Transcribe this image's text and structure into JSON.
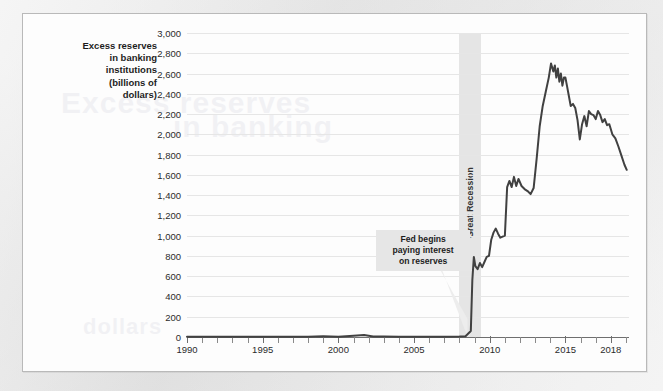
{
  "figure": {
    "y_axis_title": "Excess reserves\nin banking\ninstitutions\n(billions of\ndollars)",
    "recession_label": "Great Recession",
    "annotation": "Fed begins\npaying interest\non reserves"
  },
  "colors": {
    "line": "#414141",
    "grid": "#e6e6e6",
    "band": "#e4e4e4",
    "annotation_bg": "#e6e6e6",
    "card_bg": "#fdfdfd",
    "page_bg": "#e9e9e9",
    "axis": "#6f6f6f",
    "text": "#1d1d1d"
  },
  "bleed_text": {
    "line1": "Excess reserves",
    "line2": "in banking",
    "line3": "dollars"
  },
  "chart_data": {
    "type": "line",
    "title": "",
    "xlabel": "",
    "ylabel": "Excess reserves in banking institutions (billions of dollars)",
    "xlim": [
      1990,
      2019.2
    ],
    "ylim": [
      0,
      3000
    ],
    "ytick_step": 200,
    "grid": true,
    "legend": false,
    "yticks": [
      0,
      200,
      400,
      600,
      800,
      1000,
      1200,
      1400,
      1600,
      1800,
      2000,
      2200,
      2400,
      2600,
      2800,
      3000
    ],
    "ytick_labels": [
      "0",
      "200",
      "400",
      "600",
      "800",
      "1,000",
      "1,200",
      "1,400",
      "1,600",
      "1,800",
      "2,000",
      "2,200",
      "2,400",
      "2,600",
      "2,800",
      "3,000"
    ],
    "xticks": [
      1990,
      1991,
      1992,
      1993,
      1994,
      1995,
      1996,
      1997,
      1998,
      1999,
      2000,
      2001,
      2002,
      2003,
      2004,
      2005,
      2006,
      2007,
      2008,
      2009,
      2010,
      2011,
      2012,
      2013,
      2014,
      2015,
      2016,
      2017,
      2018,
      2019
    ],
    "xtick_labels_shown": [
      "1990",
      "1995",
      "2000",
      "2005",
      "2010",
      "2015",
      "2018"
    ],
    "xtick_labels_values": [
      1990,
      1995,
      2000,
      2005,
      2010,
      2015,
      2018
    ],
    "shaded_regions": [
      {
        "label": "Great Recession",
        "x_start": 2007.95,
        "x_end": 2009.45
      }
    ],
    "annotations": [
      {
        "text": "Fed begins paying interest on reserves",
        "x": 2005.6,
        "y": 480,
        "points_to_x": 2008.6,
        "points_to_y": 60
      }
    ],
    "series": [
      {
        "name": "Excess reserves",
        "x": [
          1990.0,
          1991.0,
          1992.0,
          1993.0,
          1994.0,
          1995.0,
          1996.0,
          1997.0,
          1998.0,
          1999.0,
          2000.0,
          2001.0,
          2001.7,
          2002.3,
          2003.0,
          2004.0,
          2005.0,
          2006.0,
          2007.0,
          2008.0,
          2008.4,
          2008.75,
          2008.85,
          2008.95,
          2009.05,
          2009.2,
          2009.35,
          2009.5,
          2009.65,
          2009.8,
          2009.95,
          2010.1,
          2010.25,
          2010.4,
          2010.55,
          2010.7,
          2010.85,
          2011.0,
          2011.15,
          2011.3,
          2011.45,
          2011.6,
          2011.75,
          2011.9,
          2012.1,
          2012.3,
          2012.5,
          2012.7,
          2012.9,
          2013.1,
          2013.3,
          2013.5,
          2013.7,
          2013.9,
          2014.05,
          2014.2,
          2014.3,
          2014.4,
          2014.5,
          2014.6,
          2014.7,
          2014.8,
          2014.9,
          2015.0,
          2015.1,
          2015.2,
          2015.35,
          2015.5,
          2015.65,
          2015.8,
          2015.95,
          2016.1,
          2016.25,
          2016.4,
          2016.55,
          2016.7,
          2016.85,
          2017.0,
          2017.15,
          2017.3,
          2017.45,
          2017.6,
          2017.75,
          2017.9,
          2018.1,
          2018.3,
          2018.5,
          2018.7,
          2018.9,
          2019.05
        ],
        "y": [
          2,
          2,
          3,
          2,
          2,
          2,
          2,
          2,
          3,
          8,
          3,
          12,
          20,
          6,
          4,
          3,
          3,
          3,
          3,
          5,
          8,
          60,
          560,
          790,
          700,
          670,
          730,
          690,
          740,
          790,
          800,
          960,
          1030,
          1070,
          1020,
          980,
          990,
          1000,
          1480,
          1540,
          1480,
          1580,
          1490,
          1560,
          1490,
          1460,
          1440,
          1410,
          1470,
          1760,
          2080,
          2280,
          2420,
          2560,
          2700,
          2620,
          2680,
          2560,
          2650,
          2520,
          2600,
          2480,
          2560,
          2560,
          2480,
          2400,
          2280,
          2300,
          2260,
          2140,
          1950,
          2100,
          2180,
          2080,
          2230,
          2200,
          2190,
          2150,
          2230,
          2190,
          2120,
          2150,
          2090,
          2100,
          2000,
          1960,
          1880,
          1790,
          1700,
          1650
        ]
      }
    ]
  }
}
